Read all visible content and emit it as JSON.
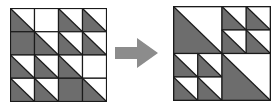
{
  "colors": {
    "fill": "#6d6d6d",
    "background": "#ffffff",
    "line": "#1a1a1a",
    "arrow": "#8c8c8c"
  },
  "left_grid": {
    "size": 4,
    "description": "4x4 grid of half-square triangle tiles",
    "cells": [
      [
        "tri",
        "white",
        "tri",
        "tri"
      ],
      [
        "gray",
        "tri",
        "tri",
        "tri"
      ],
      [
        "tri",
        "tri",
        "tri",
        "white"
      ],
      [
        "tri",
        "tri",
        "gray",
        "tri"
      ]
    ]
  },
  "arrow": {
    "direction": "right",
    "icon": "arrow-right-icon"
  },
  "right_grid": {
    "description": "Quadrant layout: large triangle top-left, 2x2 small triangles top-right, 2x2 small triangles bottom-left, large triangle bottom-right",
    "quadrants": {
      "top_left": "large-tri",
      "top_right": [
        [
          "tri",
          "tri"
        ],
        [
          "tri",
          "tri"
        ]
      ],
      "bottom_left": [
        [
          "tri",
          "tri"
        ],
        [
          "tri",
          "tri"
        ]
      ],
      "bottom_right": "large-tri"
    }
  }
}
